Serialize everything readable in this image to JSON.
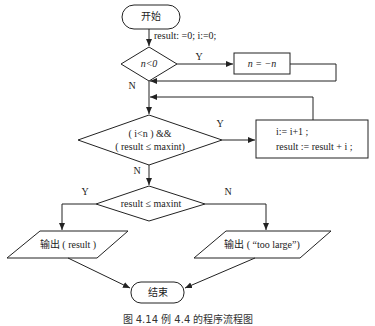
{
  "flowchart": {
    "start": "开始",
    "init": "result: =0; i:=0;",
    "decision1": {
      "label": "n<0",
      "yes": "Y",
      "no": "N"
    },
    "negate": "n = −n",
    "decision2": {
      "line1": "( i<n )  &&",
      "line2": "( result ≤ maxint)",
      "yes": "Y",
      "no": "N"
    },
    "loop_body": {
      "line1": "i:= i+1 ;",
      "line2": "result :=   result + i ;"
    },
    "decision3": {
      "label": "result ≤ maxint",
      "yes": "Y",
      "no": "N"
    },
    "output_left": "输出 ( result )",
    "output_right": "输出 ( “too large”)",
    "end": "结束"
  },
  "caption": "图 4.14   例 4.4 的程序流程图",
  "colors": {
    "stroke": "#222222",
    "background": "#ffffff"
  }
}
